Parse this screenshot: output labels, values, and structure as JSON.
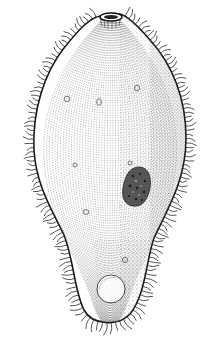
{
  "illustration": {
    "subject": "ciliate protozoan",
    "style": "black ink stipple line drawing",
    "background": "#ffffff",
    "ink": "#1a1a1a",
    "parts": [
      {
        "name": "cytostome",
        "position": "top"
      },
      {
        "name": "cilia",
        "position": "perimeter"
      },
      {
        "name": "macronucleus",
        "position": "right-center"
      },
      {
        "name": "food-vacuoles",
        "count": 6
      },
      {
        "name": "contractile-vacuole",
        "position": "bottom"
      }
    ]
  }
}
